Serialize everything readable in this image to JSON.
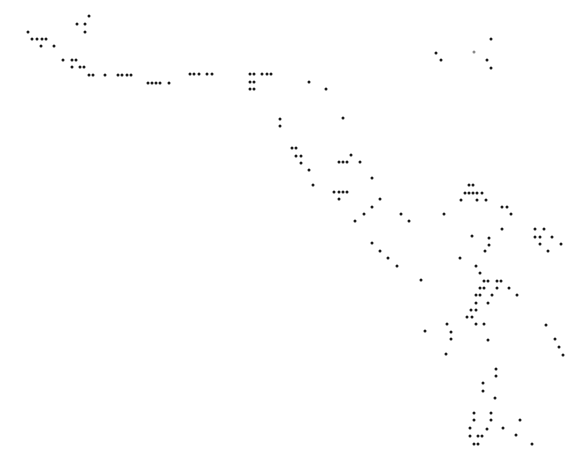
{
  "figure": {
    "background_color": "#ffffff",
    "dot_color": "#1a1a1a",
    "dot_size_px": 3
  },
  "dots": [
    [
      28,
      32
    ],
    [
      32,
      39
    ],
    [
      37,
      39
    ],
    [
      42,
      39
    ],
    [
      46,
      39
    ],
    [
      41,
      46
    ],
    [
      54,
      46
    ],
    [
      77,
      24
    ],
    [
      85,
      24
    ],
    [
      89,
      16
    ],
    [
      85,
      32
    ],
    [
      63,
      60
    ],
    [
      72,
      60
    ],
    [
      76,
      60
    ],
    [
      72,
      67
    ],
    [
      80,
      67
    ],
    [
      84,
      67
    ],
    [
      89,
      75
    ],
    [
      93,
      75
    ],
    [
      105,
      75
    ],
    [
      118,
      75
    ],
    [
      122,
      75
    ],
    [
      127,
      75
    ],
    [
      131,
      75
    ],
    [
      148,
      83
    ],
    [
      152,
      83
    ],
    [
      156,
      83
    ],
    [
      160,
      83
    ],
    [
      169,
      83
    ],
    [
      190,
      74
    ],
    [
      194,
      74
    ],
    [
      199,
      74
    ],
    [
      207,
      74
    ],
    [
      212,
      74
    ],
    [
      250,
      74
    ],
    [
      254,
      74
    ],
    [
      262,
      74
    ],
    [
      267,
      74
    ],
    [
      271,
      74
    ],
    [
      250,
      82
    ],
    [
      254,
      82
    ],
    [
      250,
      89
    ],
    [
      254,
      89
    ],
    [
      309,
      82
    ],
    [
      326,
      89
    ],
    [
      436,
      53
    ],
    [
      441,
      60
    ],
    [
      474,
      52
    ],
    [
      491,
      39
    ],
    [
      487,
      60
    ],
    [
      491,
      68
    ],
    [
      280,
      119
    ],
    [
      280,
      126
    ],
    [
      343,
      118
    ],
    [
      292,
      148
    ],
    [
      296,
      148
    ],
    [
      296,
      156
    ],
    [
      301,
      156
    ],
    [
      301,
      163
    ],
    [
      309,
      170
    ],
    [
      313,
      185
    ],
    [
      351,
      155
    ],
    [
      339,
      162
    ],
    [
      343,
      162
    ],
    [
      347,
      162
    ],
    [
      360,
      162
    ],
    [
      372,
      178
    ],
    [
      334,
      192
    ],
    [
      339,
      192
    ],
    [
      343,
      192
    ],
    [
      347,
      192
    ],
    [
      339,
      199
    ],
    [
      380,
      199
    ],
    [
      372,
      207
    ],
    [
      364,
      214
    ],
    [
      355,
      221
    ],
    [
      401,
      214
    ],
    [
      409,
      221
    ],
    [
      444,
      214
    ],
    [
      372,
      243
    ],
    [
      380,
      251
    ],
    [
      388,
      258
    ],
    [
      397,
      266
    ],
    [
      421,
      280
    ],
    [
      469,
      185
    ],
    [
      473,
      185
    ],
    [
      465,
      193
    ],
    [
      469,
      193
    ],
    [
      473,
      193
    ],
    [
      477,
      193
    ],
    [
      482,
      193
    ],
    [
      461,
      200
    ],
    [
      477,
      200
    ],
    [
      486,
      200
    ],
    [
      502,
      207
    ],
    [
      507,
      207
    ],
    [
      511,
      214
    ],
    [
      502,
      229
    ],
    [
      472,
      236
    ],
    [
      489,
      238
    ],
    [
      489,
      245
    ],
    [
      485,
      251
    ],
    [
      460,
      258
    ],
    [
      535,
      229
    ],
    [
      544,
      229
    ],
    [
      535,
      237
    ],
    [
      540,
      237
    ],
    [
      552,
      237
    ],
    [
      540,
      244
    ],
    [
      561,
      244
    ],
    [
      548,
      251
    ],
    [
      476,
      266
    ],
    [
      480,
      273
    ],
    [
      484,
      281
    ],
    [
      488,
      281
    ],
    [
      497,
      281
    ],
    [
      501,
      281
    ],
    [
      480,
      288
    ],
    [
      484,
      288
    ],
    [
      497,
      288
    ],
    [
      509,
      288
    ],
    [
      517,
      295
    ],
    [
      476,
      295
    ],
    [
      480,
      295
    ],
    [
      492,
      295
    ],
    [
      476,
      303
    ],
    [
      488,
      303
    ],
    [
      471,
      310
    ],
    [
      476,
      310
    ],
    [
      467,
      317
    ],
    [
      472,
      317
    ],
    [
      476,
      324
    ],
    [
      484,
      324
    ],
    [
      447,
      324
    ],
    [
      425,
      331
    ],
    [
      451,
      332
    ],
    [
      451,
      339
    ],
    [
      488,
      340
    ],
    [
      446,
      354
    ],
    [
      546,
      325
    ],
    [
      555,
      339
    ],
    [
      559,
      347
    ],
    [
      563,
      355
    ],
    [
      496,
      369
    ],
    [
      496,
      376
    ],
    [
      483,
      383
    ],
    [
      483,
      391
    ],
    [
      495,
      398
    ],
    [
      474,
      413
    ],
    [
      491,
      413
    ],
    [
      474,
      420
    ],
    [
      491,
      420
    ],
    [
      520,
      420
    ],
    [
      470,
      428
    ],
    [
      487,
      429
    ],
    [
      503,
      428
    ],
    [
      470,
      436
    ],
    [
      478,
      436
    ],
    [
      482,
      436
    ],
    [
      516,
      435
    ],
    [
      474,
      444
    ],
    [
      478,
      444
    ],
    [
      532,
      444
    ]
  ],
  "faint_dots": [
    [
      474,
      52
    ]
  ]
}
